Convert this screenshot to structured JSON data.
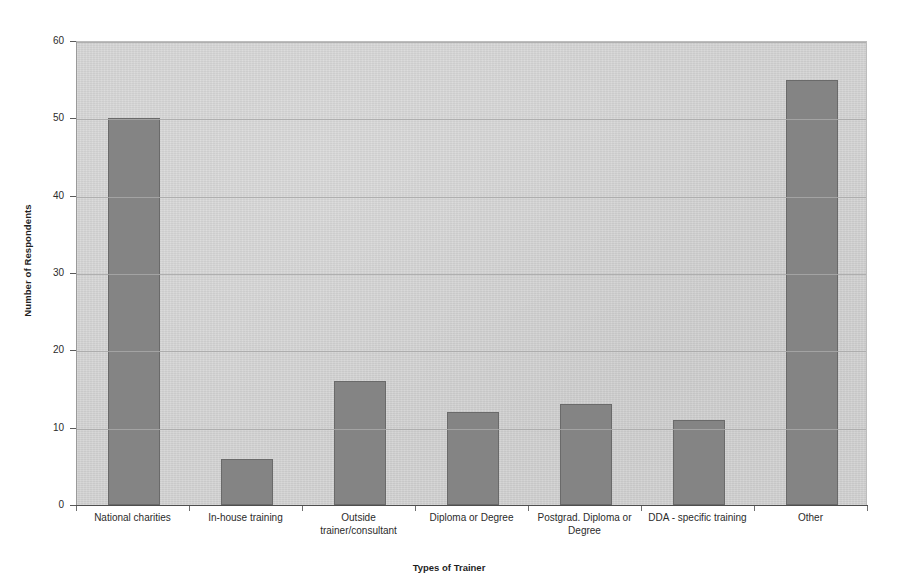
{
  "chart_data": {
    "type": "bar",
    "title": "",
    "xlabel": "Types of Trainer",
    "ylabel": "Number of Respondents",
    "categories": [
      "National charities",
      "In-house training",
      "Outside trainer/consultant",
      "Diploma or Degree",
      "Postgrad. Diploma or Degree",
      "DDA - specific training",
      "Other"
    ],
    "values": [
      50,
      6,
      16,
      12,
      13,
      11,
      55
    ],
    "ylim": [
      0,
      60
    ],
    "ytick_values": [
      0,
      10,
      20,
      30,
      40,
      50,
      60
    ],
    "ytick_labels": [
      "0",
      "10",
      "20",
      "30",
      "40",
      "50",
      "60"
    ],
    "grid": true,
    "legend": false,
    "bar_color": "#848484",
    "plot_background": "#d3d3d3",
    "gridline_color": "#a8a8a8",
    "axis_color": "#4f4f4f"
  }
}
